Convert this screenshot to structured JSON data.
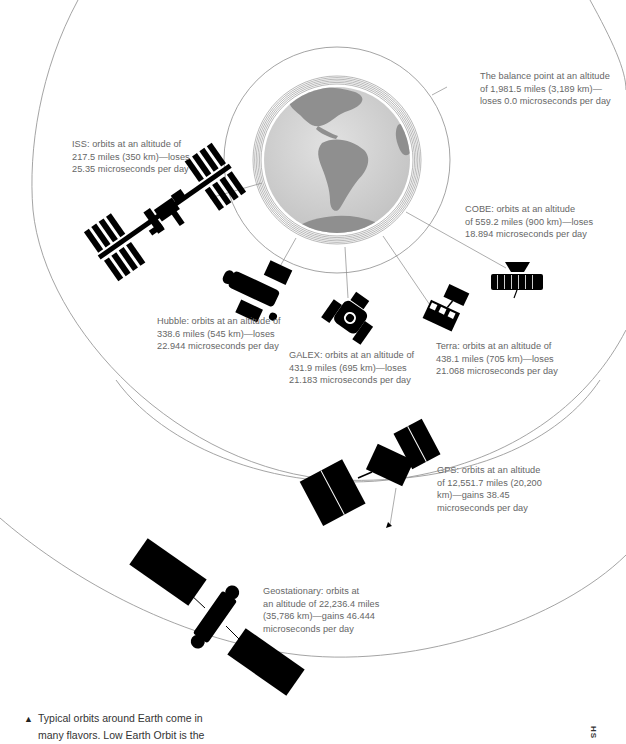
{
  "figure": {
    "center": {
      "x": 337,
      "y": 160
    },
    "colors": {
      "orbit_line": "#9a9a9a",
      "leader_line": "#8a8a8a",
      "label_text": "#666666",
      "satellite": "#000000",
      "globe_ocean": "#d4d4d4",
      "globe_land": "#8f8f8f"
    }
  },
  "labels": {
    "balance": [
      "The balance point at an altitude",
      "of 1,981.5 miles (3,189 km)—",
      "loses 0.0 microseconds per day"
    ],
    "iss": [
      "ISS: orbits at an altitude of",
      "217.5 miles (350 km)—loses",
      "25.35 microseconds per day"
    ],
    "cobe": [
      "COBE: orbits at an altitude",
      "of 559.2 miles (900 km)—loses",
      "18.894 microseconds per day"
    ],
    "hubble": [
      "Hubble: orbits at an altitude of",
      "338.6 miles (545 km)—loses",
      "22.944 microseconds per day"
    ],
    "galex": [
      "GALEX: orbits at an altitude of",
      "431.9 miles (695 km)—loses",
      "21.183 microseconds per day"
    ],
    "terra": [
      "Terra: orbits at an altitude of",
      "438.1 miles (705 km)—loses",
      "21.068 microseconds per day"
    ],
    "gps": [
      "GPS: orbits at an altitude",
      "of 12,551.7 miles (20,200",
      "km)—gains 38.45",
      "microseconds per day"
    ],
    "geo": [
      "Geostationary: orbits at",
      "an altitude of 22,236.4 miles",
      "(35,786 km)—gains 46.444",
      "microseconds per day"
    ]
  },
  "satellites": [
    {
      "name": "ISS",
      "altitude_mi": 217.5,
      "altitude_km": 350,
      "drift_us_per_day": -25.35
    },
    {
      "name": "Hubble",
      "altitude_mi": 338.6,
      "altitude_km": 545,
      "drift_us_per_day": -22.944
    },
    {
      "name": "GALEX",
      "altitude_mi": 431.9,
      "altitude_km": 695,
      "drift_us_per_day": -21.183
    },
    {
      "name": "Terra",
      "altitude_mi": 438.1,
      "altitude_km": 705,
      "drift_us_per_day": -21.068
    },
    {
      "name": "COBE",
      "altitude_mi": 559.2,
      "altitude_km": 900,
      "drift_us_per_day": -18.894
    },
    {
      "name": "Balance point",
      "altitude_mi": 1981.5,
      "altitude_km": 3189,
      "drift_us_per_day": 0.0
    },
    {
      "name": "GPS",
      "altitude_mi": 12551.7,
      "altitude_km": 20200,
      "drift_us_per_day": 38.45
    },
    {
      "name": "Geostationary",
      "altitude_mi": 22236.4,
      "altitude_km": 35786,
      "drift_us_per_day": 46.444
    }
  ],
  "caption": {
    "marker": "▲",
    "lines": [
      "Typical orbits around Earth come in",
      "many flavors. Low Earth Orbit is the"
    ]
  },
  "side_tag": "HS"
}
